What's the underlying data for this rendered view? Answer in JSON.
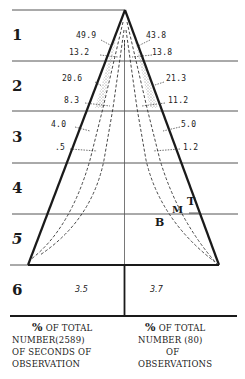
{
  "rows": [
    {
      "label": "1"
    },
    {
      "label": "2"
    },
    {
      "label": "3"
    },
    {
      "label": "4"
    },
    {
      "label": "5"
    },
    {
      "label": "6"
    }
  ],
  "left_values": {
    "row1_outer": "49.9",
    "row1_inner": "13.2",
    "row2_outer": "20.6",
    "row2_inner": "8.3",
    "row3_outer": "4.0",
    "row3_inner": ".5"
  },
  "right_values": {
    "row1_outer": "43.8",
    "row1_inner": "13.8",
    "row2_outer": "21.3",
    "row2_inner": "11.2",
    "row3_outer": "5.0",
    "row3_inner": "1.2"
  },
  "row6_values": {
    "left": "3.5",
    "right": "3.7"
  },
  "curve_labels": {
    "t": "T",
    "m": "M",
    "b": "B"
  },
  "captions": {
    "left": {
      "pct": "%",
      "line1": "OF TOTAL",
      "line2": "NUMBER(2589)",
      "line3": "OF SECONDS OF",
      "line4": "OBSERVATION"
    },
    "right": {
      "pct": "%",
      "line1": "OF TOTAL",
      "line2": "NUMBER (80)",
      "line3": "OF",
      "line4": "OBSERVATIONS"
    }
  },
  "colors": {
    "ink": "#1a1a1a",
    "stipple": "#9a9a9a",
    "background": "#ffffff"
  }
}
